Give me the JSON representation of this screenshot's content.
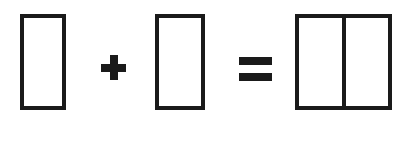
{
  "diagram": {
    "background_color": "#ffffff",
    "stroke_color": "#1a1a1a",
    "canvas": {
      "width": 412,
      "height": 142
    },
    "terms": [
      {
        "id": "rect-a",
        "kind": "rectangle",
        "name": "first-rectangle",
        "label": "",
        "x": 20,
        "y": 14,
        "width": 46,
        "height": 96,
        "stroke_width": 4,
        "fill": "#ffffff",
        "stroke": "#1a1a1a",
        "parts": 1
      },
      {
        "id": "plus-operator",
        "kind": "operator",
        "name": "plus-sign",
        "label": "+",
        "x": 101,
        "y": 55,
        "width": 25,
        "height": 25,
        "stroke_width": 8,
        "fill": "#1a1a1a"
      },
      {
        "id": "rect-b",
        "kind": "rectangle",
        "name": "second-rectangle",
        "label": "",
        "x": 155,
        "y": 14,
        "width": 50,
        "height": 96,
        "stroke_width": 4,
        "fill": "#ffffff",
        "stroke": "#1a1a1a",
        "parts": 1
      },
      {
        "id": "equals-operator",
        "kind": "operator",
        "name": "equals-sign",
        "label": "=",
        "x": 239,
        "y": 57,
        "width": 33,
        "height": 24,
        "bar_height": 8,
        "bar_gap": 8,
        "fill": "#1a1a1a"
      },
      {
        "id": "rect-result",
        "kind": "rectangle",
        "name": "result-rectangle",
        "label": "",
        "x": 295,
        "y": 14,
        "width": 97,
        "height": 96,
        "stroke_width": 4,
        "fill": "#ffffff",
        "stroke": "#1a1a1a",
        "parts": 2,
        "divider": {
          "name": "vertical-divider",
          "offset_x": 43,
          "width": 4,
          "color": "#1a1a1a"
        }
      }
    ],
    "equation_text": "+ ="
  }
}
